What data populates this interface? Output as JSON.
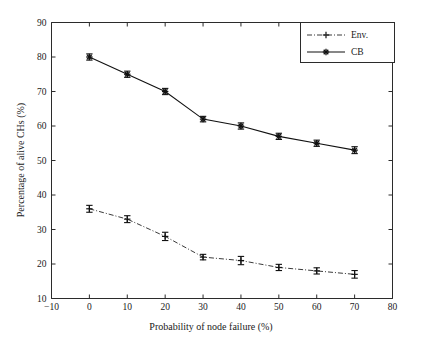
{
  "chart_data": {
    "type": "line",
    "title": "",
    "xlabel": "Probability of node failure (%)",
    "ylabel": "Percentage of alive CHs (%)",
    "xlim": [
      -10,
      80
    ],
    "ylim": [
      10,
      90
    ],
    "xticks": [
      "-10",
      "0",
      "10",
      "20",
      "30",
      "40",
      "50",
      "60",
      "70",
      "80"
    ],
    "yticks": [
      "10",
      "20",
      "30",
      "40",
      "50",
      "60",
      "70",
      "80",
      "90"
    ],
    "x": [
      0,
      10,
      20,
      30,
      40,
      50,
      60,
      70
    ],
    "grid": false,
    "legend_position": "top-right",
    "series": [
      {
        "name": "Env.",
        "linestyle": "dash-dot",
        "marker": "plus",
        "color": "#3a3a3a",
        "values": [
          36,
          33,
          28,
          22,
          21,
          19,
          18,
          17
        ],
        "errors": [
          1.0,
          1.0,
          1.2,
          0.8,
          1.2,
          0.9,
          0.9,
          1.1
        ]
      },
      {
        "name": "CB",
        "linestyle": "solid",
        "marker": "star",
        "color": "#111111",
        "values": [
          80,
          75,
          70,
          62,
          60,
          57,
          55,
          53
        ],
        "errors": [
          0.9,
          0.9,
          0.9,
          0.8,
          0.9,
          0.9,
          0.9,
          1.0
        ]
      }
    ]
  },
  "legend": {
    "entries": [
      {
        "label": "Env."
      },
      {
        "label": "CB"
      }
    ]
  }
}
